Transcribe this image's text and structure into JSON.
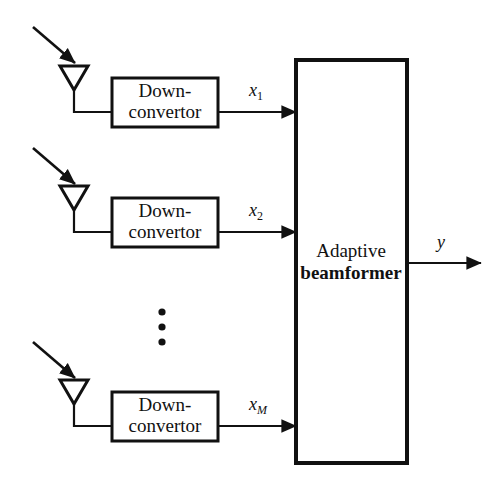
{
  "figure": {
    "kind": "block-diagram",
    "background_color": "#ffffff",
    "line_color": "#111111",
    "text_color": "#111111"
  },
  "blocks": {
    "downconvertor_label_line1": "Down-",
    "downconvertor_label_line2": "convertor",
    "beamformer_label_line1": "Adaptive",
    "beamformer_label_line2": "beamformer"
  },
  "channels": [
    {
      "id": "channel-1",
      "antenna_name": "antenna-1",
      "incoming_wave_arrow": "incoming-signal-arrow-1",
      "downconvertor_name": "downconvertor-1",
      "signal_base": "x",
      "signal_subscript": "1",
      "signal_subscript_italic": false,
      "signal_label": "x1"
    },
    {
      "id": "channel-2",
      "antenna_name": "antenna-2",
      "incoming_wave_arrow": "incoming-signal-arrow-2",
      "downconvertor_name": "downconvertor-2",
      "signal_base": "x",
      "signal_subscript": "2",
      "signal_subscript_italic": false,
      "signal_label": "x2"
    },
    {
      "id": "channel-m",
      "antenna_name": "antenna-m",
      "incoming_wave_arrow": "incoming-signal-arrow-m",
      "downconvertor_name": "downconvertor-m",
      "signal_base": "x",
      "signal_subscript": "M",
      "signal_subscript_italic": true,
      "signal_label": "xM"
    }
  ],
  "ellipsis": {
    "name": "vertical-ellipsis",
    "glyph": "⋮",
    "dot_count": 3
  },
  "output": {
    "name": "beamformer-output-arrow",
    "label": "y"
  }
}
